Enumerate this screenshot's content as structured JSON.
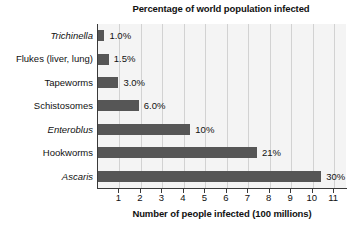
{
  "chart_data": {
    "type": "bar",
    "orientation": "horizontal",
    "title": "Percentage of world population infected",
    "xlabel": "Number of people infected (100 millions)",
    "ylabel": "",
    "xlim": [
      0,
      11.55
    ],
    "ylim": null,
    "grid": true,
    "legend": null,
    "xticks": [
      "1",
      "2",
      "3",
      "4",
      "5",
      "6",
      "7",
      "8",
      "9",
      "10",
      "11"
    ],
    "xtick_values": [
      1,
      2,
      3,
      4,
      5,
      6,
      7,
      8,
      9,
      10,
      11
    ],
    "categories": [
      "Trichinella",
      "Flukes (liver, lung)",
      "Tapeworms",
      "Schistosomes",
      "Enteroblus",
      "Hookworms",
      "Ascaris"
    ],
    "values": [
      0.3,
      0.5,
      0.95,
      1.9,
      4.3,
      7.4,
      10.4
    ],
    "data_labels": [
      "1.0%",
      "1.5%",
      "3.0%",
      "6.0%",
      "10%",
      "21%",
      "30%"
    ],
    "series": [
      {
        "name": "Number of people infected (100 millions)",
        "values": [
          0.3,
          0.5,
          0.95,
          1.9,
          4.3,
          7.4,
          10.4
        ]
      }
    ],
    "points": [
      {
        "category": "Trichinella",
        "value": 0.3,
        "label": "1.0%",
        "italic": true
      },
      {
        "category": "Flukes (liver, lung)",
        "value": 0.5,
        "label": "1.5%",
        "italic": false
      },
      {
        "category": "Tapeworms",
        "value": 0.95,
        "label": "3.0%",
        "italic": false
      },
      {
        "category": "Schistosomes",
        "value": 1.9,
        "label": "6.0%",
        "italic": false
      },
      {
        "category": "Enteroblus",
        "value": 4.3,
        "label": "10%",
        "italic": true
      },
      {
        "category": "Hookworms",
        "value": 7.4,
        "label": "21%",
        "italic": false
      },
      {
        "category": "Ascaris",
        "value": 10.4,
        "label": "30%",
        "italic": true
      }
    ],
    "colors": {
      "bar_fill": "#565656",
      "plot_background": "#f4f4f4",
      "gridline": "#d2d2d2",
      "axis": "#3a3a3a",
      "text": "#111111",
      "page_background": "#ffffff"
    }
  }
}
